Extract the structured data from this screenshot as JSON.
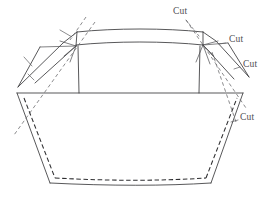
{
  "figure": {
    "background_color": "#ffffff",
    "line_color": "#3a3a3c",
    "dash_color": "#2e2e30",
    "label_color": "#4e4e51",
    "width": 275,
    "height": 200
  },
  "labels": {
    "cut_1": "Cut",
    "cut_2": "Cut",
    "cut_3": "Cut",
    "cut_4": "Cut"
  },
  "label_positions": [
    {
      "name": "cut-label-top",
      "text": "Cut",
      "x": 173,
      "y": 11
    },
    {
      "name": "cut-label-upper-right",
      "text": "Cut",
      "x": 228,
      "y": 40
    },
    {
      "name": "cut-label-middle-right",
      "text": "Cut",
      "x": 243,
      "y": 65
    },
    {
      "name": "cut-label-lower-right",
      "text": "Cut",
      "x": 240,
      "y": 118
    }
  ],
  "geometry": {
    "center_panel_top_outer": "M 77,32 C 115,28 165,28 203,32",
    "center_panel_top_inner": "M 76,45 C 115,41 165,41 203,45",
    "center_panel_left_side": "M 78,46 L 79,93",
    "center_panel_right_side": "M 200,46 L 199,93",
    "left_flap_outer": "M 77,32 L 63,43 L 18,87",
    "left_flap_inner": "M 76,46 L 35,83",
    "left_vertex_corner": "M 77,32 L 76,46",
    "left_lower_wedge": "M 18,87 L 40,47",
    "left_wedge_to_vertex": "M 40,47 L 76,46",
    "right_flap_outer": "M 203,32 L 216,41 L 249,77",
    "right_flap_inner": "M 203,45 L 234,79",
    "right_vertex_corner": "M 203,32 L 203,45",
    "right_lower_wedge": "M 249,77 L 228,43",
    "right_wedge_to_vertex": "M 228,43 L 203,45",
    "waist_line": "M 17,93 L 243,93",
    "body_left_side": "M 17,93 L 50,183",
    "body_right_side": "M 243,93 L 211,183",
    "body_bottom": "M 50,183 C 110,186 165,186 211,183",
    "stitch_left": "M 24,98 L 55,178",
    "stitch_bottom": "M 55,178 C 112,181 160,181 206,178",
    "stitch_right": "M 206,178 L 237,98",
    "fold_dash_left_long": "M 95,22 L 14,135",
    "fold_dash_left_short": "M 86,17 L 70,40",
    "fold_dash_right_long": "M 186,20 L 246,108",
    "fold_dash_right_inner": "M 212,52 L 236,122",
    "tick_left_a": "M 60,30 L 72,37",
    "tick_left_b": "M 24,57 L 32,66",
    "tick_left_c": "M 28,74 L 34,80",
    "tick_right_a": "M 215,48 L 205,45",
    "vertex_rays_left": "M 76,46 L 60,41 M 76,46 L 64,56 M 76,46 L 70,62",
    "vertex_rays_right": "M 203,45 L 218,41 M 203,45 L 214,56 M 203,45 L 210,64 M 203,45 L 196,62"
  }
}
